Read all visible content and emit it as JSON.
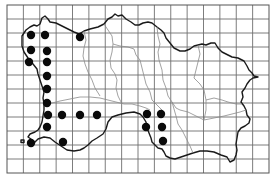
{
  "map": {
    "title": "Distribution map (Jersey, grid squares)",
    "grid": {
      "left": 7,
      "top": 5,
      "right": 269,
      "bottom": 173,
      "columns": 16,
      "rows": 12,
      "line_color": "#6e6e6e"
    },
    "colors": {
      "background": "#ffffff",
      "coastline": "#1a1a1a",
      "parish_boundary": "#8a8a8a",
      "record_dot": "#0a0a0a"
    },
    "record_dots": [
      {
        "x": 31,
        "y": 35
      },
      {
        "x": 45,
        "y": 35
      },
      {
        "x": 31,
        "y": 50
      },
      {
        "x": 47,
        "y": 51
      },
      {
        "x": 29,
        "y": 62
      },
      {
        "x": 47,
        "y": 62
      },
      {
        "x": 47,
        "y": 76
      },
      {
        "x": 47,
        "y": 89
      },
      {
        "x": 47,
        "y": 103
      },
      {
        "x": 48,
        "y": 115
      },
      {
        "x": 62,
        "y": 115
      },
      {
        "x": 80,
        "y": 115
      },
      {
        "x": 97,
        "y": 115
      },
      {
        "x": 47,
        "y": 127
      },
      {
        "x": 31,
        "y": 143
      },
      {
        "x": 63,
        "y": 142
      },
      {
        "x": 147,
        "y": 114
      },
      {
        "x": 161,
        "y": 114
      },
      {
        "x": 146,
        "y": 127
      },
      {
        "x": 162,
        "y": 127
      },
      {
        "x": 163,
        "y": 141
      },
      {
        "x": 80,
        "y": 37
      }
    ],
    "dot_radius": 4.2,
    "caption": ""
  }
}
